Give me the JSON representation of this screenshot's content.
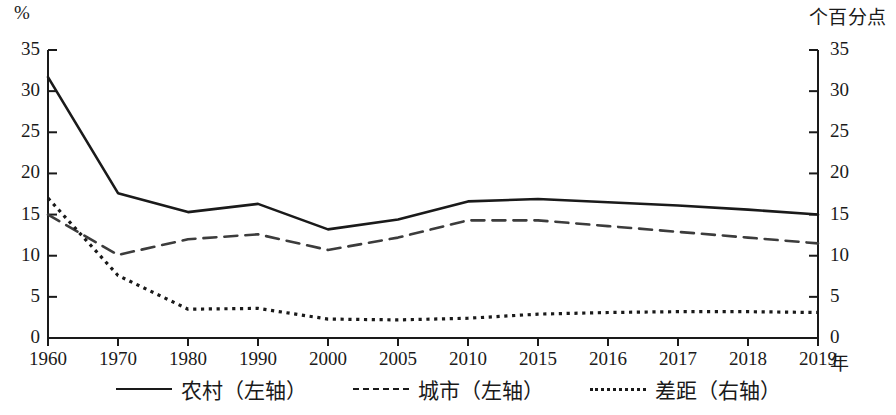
{
  "axes": {
    "left_unit": "%",
    "right_unit": "个百分点",
    "x_unit": "年"
  },
  "chart_data": {
    "type": "line",
    "title": "",
    "subtitle": "",
    "xlabel": "年",
    "ylabel": "%",
    "y2label": "个百分点",
    "categories": [
      "1960",
      "1970",
      "1980",
      "1990",
      "2000",
      "2005",
      "2010",
      "2015",
      "2016",
      "2017",
      "2018",
      "2019"
    ],
    "ylim": [
      0,
      35
    ],
    "y2lim": [
      0,
      35
    ],
    "yticks": [
      0,
      5,
      10,
      15,
      20,
      25,
      30,
      35
    ],
    "y2ticks": [
      0,
      5,
      10,
      15,
      20,
      25,
      30,
      35
    ],
    "grid": false,
    "legend_position": "bottom",
    "series": [
      {
        "name": "农村（左轴）",
        "axis": "left",
        "style": "solid",
        "color": "#1a1a1a",
        "values": [
          31.7,
          17.6,
          15.3,
          16.3,
          13.2,
          14.4,
          16.6,
          16.9,
          16.5,
          16.1,
          15.6,
          15.0
        ]
      },
      {
        "name": "城市（左轴）",
        "axis": "left",
        "style": "dashed",
        "color": "#3c3c3c",
        "values": [
          15.0,
          10.1,
          12.0,
          12.6,
          10.7,
          12.2,
          14.3,
          14.3,
          13.6,
          12.9,
          12.2,
          11.5
        ]
      },
      {
        "name": "差距（右轴）",
        "axis": "right",
        "style": "dotted",
        "color": "#1a1a1a",
        "values": [
          17.0,
          7.6,
          3.5,
          3.6,
          2.3,
          2.2,
          2.4,
          2.9,
          3.1,
          3.2,
          3.2,
          3.1
        ]
      }
    ]
  },
  "legend": [
    {
      "label": "农村（左轴）",
      "style": "solid"
    },
    {
      "label": "城市（左轴）",
      "style": "dashed"
    },
    {
      "label": "差距（右轴）",
      "style": "dotted"
    }
  ]
}
